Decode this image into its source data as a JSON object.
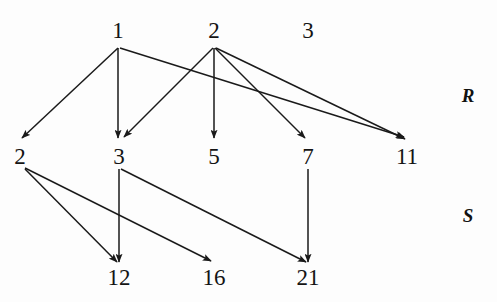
{
  "figure": {
    "width": 497,
    "height": 302,
    "background": "#fdfdfd",
    "ink_color": "#1a1a1a"
  },
  "row_labels": [
    {
      "id": "label-R",
      "text": "R",
      "x": 468,
      "y": 95
    },
    {
      "id": "label-S",
      "text": "S",
      "x": 468,
      "y": 215
    }
  ],
  "nodes": [
    {
      "id": "top-1",
      "label": "1",
      "x": 118,
      "y": 30,
      "row": "top"
    },
    {
      "id": "top-2",
      "label": "2",
      "x": 214,
      "y": 30,
      "row": "top"
    },
    {
      "id": "top-3",
      "label": "3",
      "x": 308,
      "y": 30,
      "row": "top"
    },
    {
      "id": "mid-2",
      "label": "2",
      "x": 20,
      "y": 156,
      "row": "middle"
    },
    {
      "id": "mid-3",
      "label": "3",
      "x": 119,
      "y": 156,
      "row": "middle"
    },
    {
      "id": "mid-5",
      "label": "5",
      "x": 214,
      "y": 156,
      "row": "middle"
    },
    {
      "id": "mid-7",
      "label": "7",
      "x": 308,
      "y": 156,
      "row": "middle"
    },
    {
      "id": "mid-11",
      "label": "11",
      "x": 407,
      "y": 156,
      "row": "middle"
    },
    {
      "id": "bot-12",
      "label": "12",
      "x": 119,
      "y": 277,
      "row": "bottom"
    },
    {
      "id": "bot-16",
      "label": "16",
      "x": 214,
      "y": 277,
      "row": "bottom"
    },
    {
      "id": "bot-21",
      "label": "21",
      "x": 308,
      "y": 277,
      "row": "bottom"
    }
  ],
  "edges": [
    {
      "id": "edge-1-to-2",
      "from": "top-1",
      "to": "mid-2",
      "x1": 118,
      "y1": 48,
      "x2": 22,
      "y2": 138
    },
    {
      "id": "edge-1-to-3",
      "from": "top-1",
      "to": "mid-3",
      "x1": 118,
      "y1": 48,
      "x2": 118,
      "y2": 138
    },
    {
      "id": "edge-1-to-11",
      "from": "top-1",
      "to": "mid-11",
      "x1": 120,
      "y1": 48,
      "x2": 404,
      "y2": 137
    },
    {
      "id": "edge-2-to-3",
      "from": "top-2",
      "to": "mid-3",
      "x1": 213,
      "y1": 48,
      "x2": 124,
      "y2": 137
    },
    {
      "id": "edge-2-to-5",
      "from": "top-2",
      "to": "mid-5",
      "x1": 214,
      "y1": 48,
      "x2": 214,
      "y2": 138
    },
    {
      "id": "edge-2-to-7",
      "from": "top-2",
      "to": "mid-7",
      "x1": 215,
      "y1": 48,
      "x2": 305,
      "y2": 138
    },
    {
      "id": "edge-2-to-11",
      "from": "top-2",
      "to": "mid-11",
      "x1": 216,
      "y1": 48,
      "x2": 405,
      "y2": 139
    },
    {
      "id": "edge-2-to-12",
      "from": "mid-2",
      "to": "bot-12",
      "x1": 25,
      "y1": 169,
      "x2": 117,
      "y2": 262
    },
    {
      "id": "edge-2-to-16",
      "from": "mid-2",
      "to": "bot-16",
      "x1": 25,
      "y1": 168,
      "x2": 211,
      "y2": 261
    },
    {
      "id": "edge-3-to-12",
      "from": "mid-3",
      "to": "bot-12",
      "x1": 119,
      "y1": 169,
      "x2": 119,
      "y2": 262
    },
    {
      "id": "edge-3-to-21",
      "from": "mid-3",
      "to": "bot-21",
      "x1": 121,
      "y1": 169,
      "x2": 306,
      "y2": 262
    },
    {
      "id": "edge-7-to-21",
      "from": "mid-7",
      "to": "bot-21",
      "x1": 308,
      "y1": 169,
      "x2": 308,
      "y2": 262
    }
  ]
}
